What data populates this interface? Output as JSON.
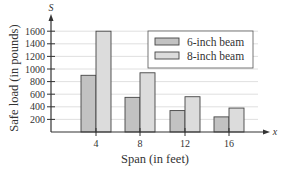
{
  "chart_data": {
    "type": "bar",
    "title": "",
    "xlabel": "Span (in feet)",
    "ylabel": "Safe load (in pounds)",
    "x_var": "x",
    "y_var": "S",
    "categories": [
      "4",
      "8",
      "12",
      "16"
    ],
    "series": [
      {
        "name": "6-inch beam",
        "values": [
          900,
          550,
          340,
          240
        ],
        "color": "#c2c2c2"
      },
      {
        "name": "8-inch beam",
        "values": [
          1600,
          940,
          560,
          380
        ],
        "color": "#dcdcdc"
      }
    ],
    "yticks": [
      200,
      400,
      600,
      800,
      1000,
      1200,
      1400,
      1600
    ],
    "ylim": [
      0,
      1700
    ],
    "grid": true,
    "legend_position": "upper right"
  }
}
